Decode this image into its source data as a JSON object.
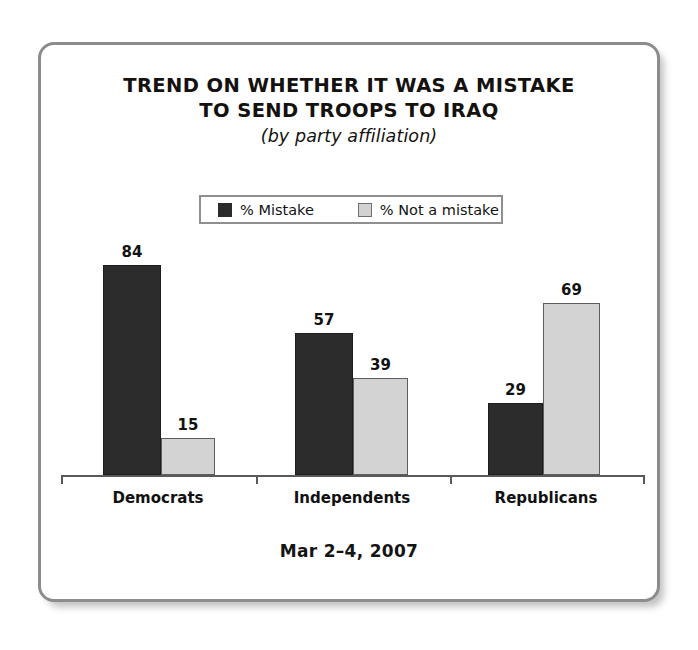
{
  "card": {
    "border_color": "#8c8c8c",
    "background": "#ffffff"
  },
  "title": {
    "line1": "TREND ON WHETHER IT WAS A MISTAKE",
    "line2": "TO SEND TROOPS TO IRAQ",
    "subtitle": "(by party affiliation)"
  },
  "legend": {
    "items": [
      {
        "label": "% Mistake",
        "swatch": "dark-square-icon",
        "color": "#2b2b2b"
      },
      {
        "label": "% Not a mistake",
        "swatch": "light-square-icon",
        "color": "#d2d2d2"
      }
    ]
  },
  "footer": {
    "date": "Mar 2–4, 2007"
  },
  "chart_data": {
    "type": "bar",
    "title": "TREND ON WHETHER IT WAS A MISTAKE TO SEND TROOPS TO IRAQ",
    "subtitle": "(by party affiliation)",
    "categories": [
      "Democrats",
      "Independents",
      "Republicans"
    ],
    "series": [
      {
        "name": "% Mistake",
        "color": "#2c2c2c",
        "values": [
          84,
          57,
          29
        ]
      },
      {
        "name": "% Not a mistake",
        "color": "#d3d3d3",
        "values": [
          15,
          39,
          69
        ]
      }
    ],
    "xlabel": "",
    "ylabel": "",
    "ylim": [
      0,
      100
    ],
    "grid": false,
    "legend_position": "top-center",
    "value_labels": true,
    "annotation": "Mar 2–4, 2007",
    "bars": [
      {
        "category": "Democrats",
        "series": "% Mistake",
        "value": 84,
        "x": 62,
        "width": 58
      },
      {
        "category": "Democrats",
        "series": "% Not a mistake",
        "value": 15,
        "x": 120,
        "width": 54
      },
      {
        "category": "Independents",
        "series": "% Mistake",
        "value": 57,
        "x": 254,
        "width": 58
      },
      {
        "category": "Independents",
        "series": "% Not a mistake",
        "value": 39,
        "x": 312,
        "width": 55
      },
      {
        "category": "Republicans",
        "series": "% Mistake",
        "value": 29,
        "x": 447,
        "width": 55
      },
      {
        "category": "Republicans",
        "series": "% Not a mistake",
        "value": 69,
        "x": 502,
        "width": 57
      }
    ],
    "axis": {
      "ticks_x": [
        20,
        215,
        409,
        602
      ],
      "baseline_y": 430,
      "px_per_unit": 2.5
    },
    "category_label_centers": [
      117,
      311,
      505
    ]
  }
}
